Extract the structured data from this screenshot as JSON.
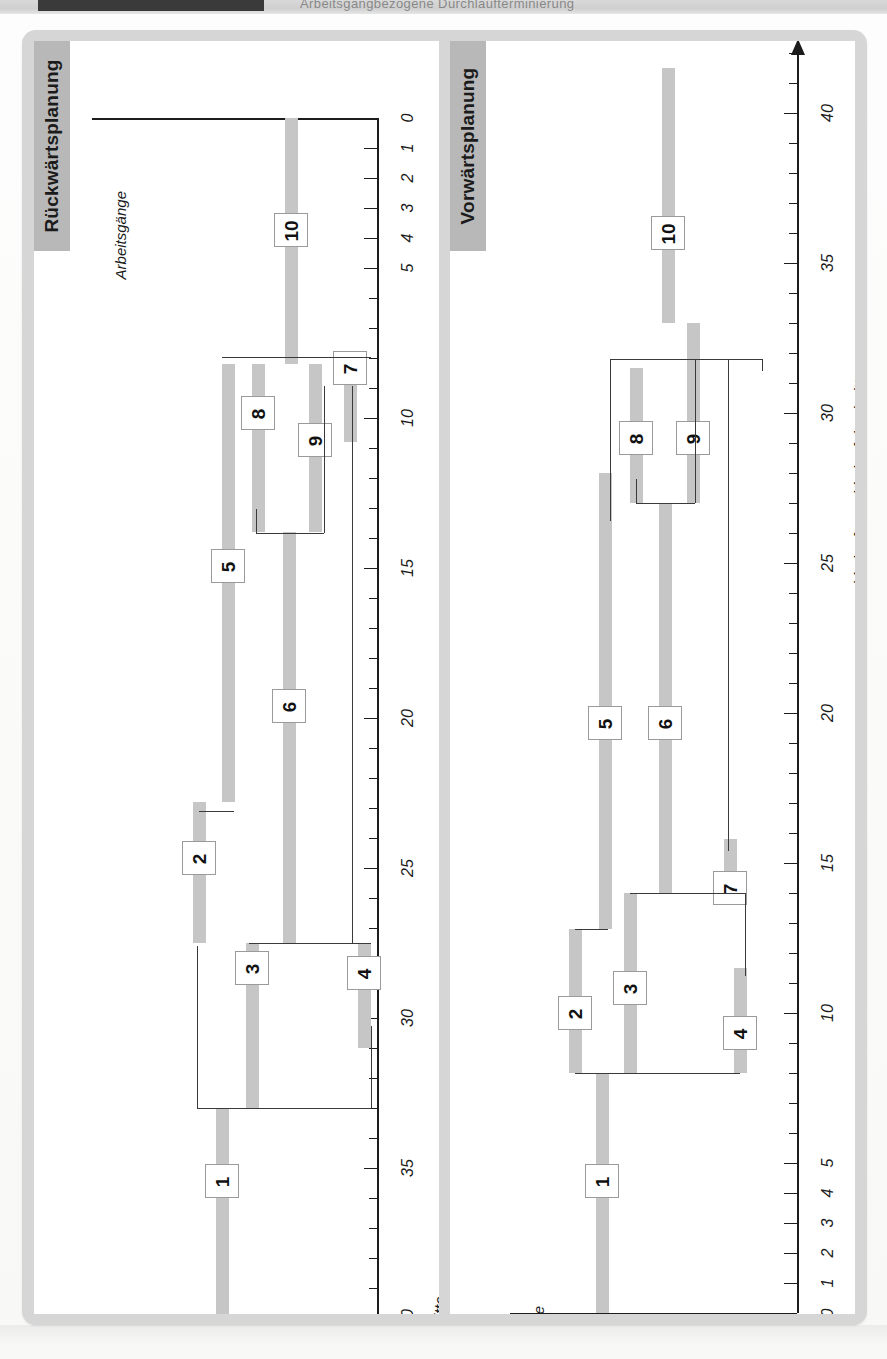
{
  "page": {
    "banner_title": "Arbeitsgangbezogene Durchlaufterminierung"
  },
  "panels": [
    {
      "id": "rueckwaerts",
      "title": "Rückwärtsplanung",
      "axis": {
        "label": "Vorlauftage, Vorlaufabschnitte",
        "category_label": "Arbeitsgänge",
        "direction": "right-to-left",
        "min": 0,
        "max": 41,
        "tick_step": 1,
        "labeled_ticks": [
          0,
          1,
          2,
          3,
          4,
          5,
          10,
          15,
          20,
          25,
          30,
          35,
          40
        ],
        "arrow": true
      },
      "operations": [
        {
          "label": "1",
          "start": 41.0,
          "end": 33.0
        },
        {
          "label": "2",
          "start": 27.5,
          "end": 22.8
        },
        {
          "label": "3",
          "start": 33.0,
          "end": 27.5
        },
        {
          "label": "4",
          "start": 31.0,
          "end": 27.5
        },
        {
          "label": "5",
          "start": 22.8,
          "end": 8.2
        },
        {
          "label": "6",
          "start": 27.5,
          "end": 13.8
        },
        {
          "label": "7",
          "start": 10.8,
          "end": 8.2
        },
        {
          "label": "8",
          "start": 13.8,
          "end": 8.2
        },
        {
          "label": "9",
          "start": 13.8,
          "end": 8.2
        },
        {
          "label": "10",
          "start": 8.2,
          "end": 0.0
        }
      ]
    },
    {
      "id": "vorwaerts",
      "title": "Vorwärtsplanung",
      "axis": {
        "label": "Vorlauftage, Vorlaufabschnitte",
        "category_label": "Arbeitsgänge",
        "direction": "left-to-right",
        "min": 0,
        "max": 42,
        "tick_step": 1,
        "labeled_ticks": [
          0,
          1,
          2,
          3,
          4,
          5,
          10,
          15,
          20,
          25,
          30,
          35,
          40
        ],
        "arrow": true
      },
      "operations": [
        {
          "label": "1",
          "start": 0.0,
          "end": 8.0
        },
        {
          "label": "2",
          "start": 8.0,
          "end": 12.8
        },
        {
          "label": "3",
          "start": 8.0,
          "end": 14.0
        },
        {
          "label": "4",
          "start": 8.0,
          "end": 11.5
        },
        {
          "label": "5",
          "start": 12.8,
          "end": 28.0
        },
        {
          "label": "6",
          "start": 14.0,
          "end": 27.0
        },
        {
          "label": "7",
          "start": 14.0,
          "end": 15.8
        },
        {
          "label": "8",
          "start": 27.0,
          "end": 31.5
        },
        {
          "label": "9",
          "start": 27.0,
          "end": 33.0
        },
        {
          "label": "10",
          "start": 33.0,
          "end": 41.5
        }
      ]
    }
  ]
}
